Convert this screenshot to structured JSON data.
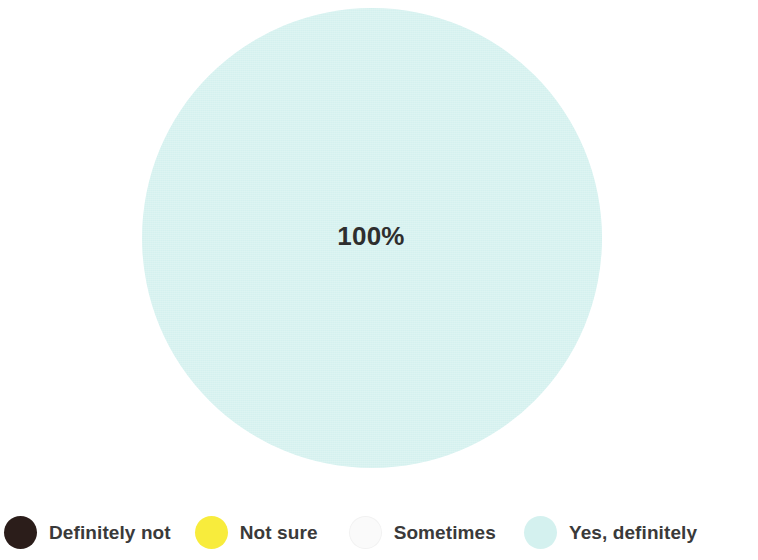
{
  "chart_data": {
    "type": "pie",
    "title": "",
    "subtitle": "",
    "xlabel": "",
    "ylabel": "",
    "grid": false,
    "legend_position": "bottom",
    "categories": [
      "Definitely not",
      "Not sure",
      "Sometimes",
      "Yes, definitely"
    ],
    "values": [
      0,
      0,
      0,
      100
    ],
    "value_unit": "%",
    "data_labels": [
      "100%"
    ],
    "colors": [
      "#2b1d1a",
      "#f8ec3c",
      "#fafafa",
      "#d4f1ef"
    ],
    "series": [
      {
        "name": "",
        "slices": [
          {
            "label": "Definitely not",
            "value": 0,
            "display": "",
            "color": "#2b1d1a"
          },
          {
            "label": "Not sure",
            "value": 0,
            "display": "",
            "color": "#f8ec3c"
          },
          {
            "label": "Sometimes",
            "value": 0,
            "display": "",
            "color": "#fafafa"
          },
          {
            "label": "Yes, definitely",
            "value": 100,
            "display": "100%",
            "color": "#d4f1ef"
          }
        ]
      }
    ]
  },
  "pie": {
    "visible_slice_label": "100%",
    "fill_color": "#d4f1ef"
  },
  "legend": {
    "items": [
      {
        "label": "Definitely not",
        "color": "#2b1d1a"
      },
      {
        "label": "Not sure",
        "color": "#f8ec3c"
      },
      {
        "label": "Sometimes",
        "color": "#fafafa"
      },
      {
        "label": "Yes, definitely",
        "color": "#d4f1ef"
      }
    ]
  },
  "colors": {
    "background": "#ffffff",
    "label_text": "#2e2e2e",
    "legend_text": "#3a3a3a"
  }
}
